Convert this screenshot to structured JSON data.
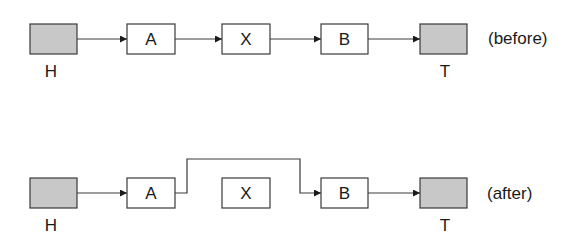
{
  "diagram": {
    "type": "linked-list-node-removal",
    "colors": {
      "stroke": "#3a3a3a",
      "sentinel_fill": "#c8c8c8",
      "node_fill": "#ffffff",
      "text": "#1a1a1a"
    },
    "rows": [
      {
        "id": "before",
        "caption": "(before)",
        "nodes": [
          {
            "id": "H",
            "label": "",
            "caption": "H",
            "sentinel": true
          },
          {
            "id": "A",
            "label": "A",
            "caption": "",
            "sentinel": false
          },
          {
            "id": "X",
            "label": "X",
            "caption": "",
            "sentinel": false
          },
          {
            "id": "B",
            "label": "B",
            "caption": "",
            "sentinel": false
          },
          {
            "id": "T",
            "label": "",
            "caption": "T",
            "sentinel": true
          }
        ],
        "edges": [
          {
            "from": "H",
            "to": "A"
          },
          {
            "from": "A",
            "to": "X"
          },
          {
            "from": "X",
            "to": "B"
          },
          {
            "from": "B",
            "to": "T"
          }
        ]
      },
      {
        "id": "after",
        "caption": "(after)",
        "nodes": [
          {
            "id": "H",
            "label": "",
            "caption": "H",
            "sentinel": true
          },
          {
            "id": "A",
            "label": "A",
            "caption": "",
            "sentinel": false
          },
          {
            "id": "X",
            "label": "X",
            "caption": "",
            "sentinel": false
          },
          {
            "id": "B",
            "label": "B",
            "caption": "",
            "sentinel": false
          },
          {
            "id": "T",
            "label": "",
            "caption": "T",
            "sentinel": true
          }
        ],
        "edges": [
          {
            "from": "H",
            "to": "A"
          },
          {
            "from": "A",
            "to": "B",
            "routing": "bypass-over-X"
          },
          {
            "from": "B",
            "to": "T"
          }
        ]
      }
    ]
  }
}
